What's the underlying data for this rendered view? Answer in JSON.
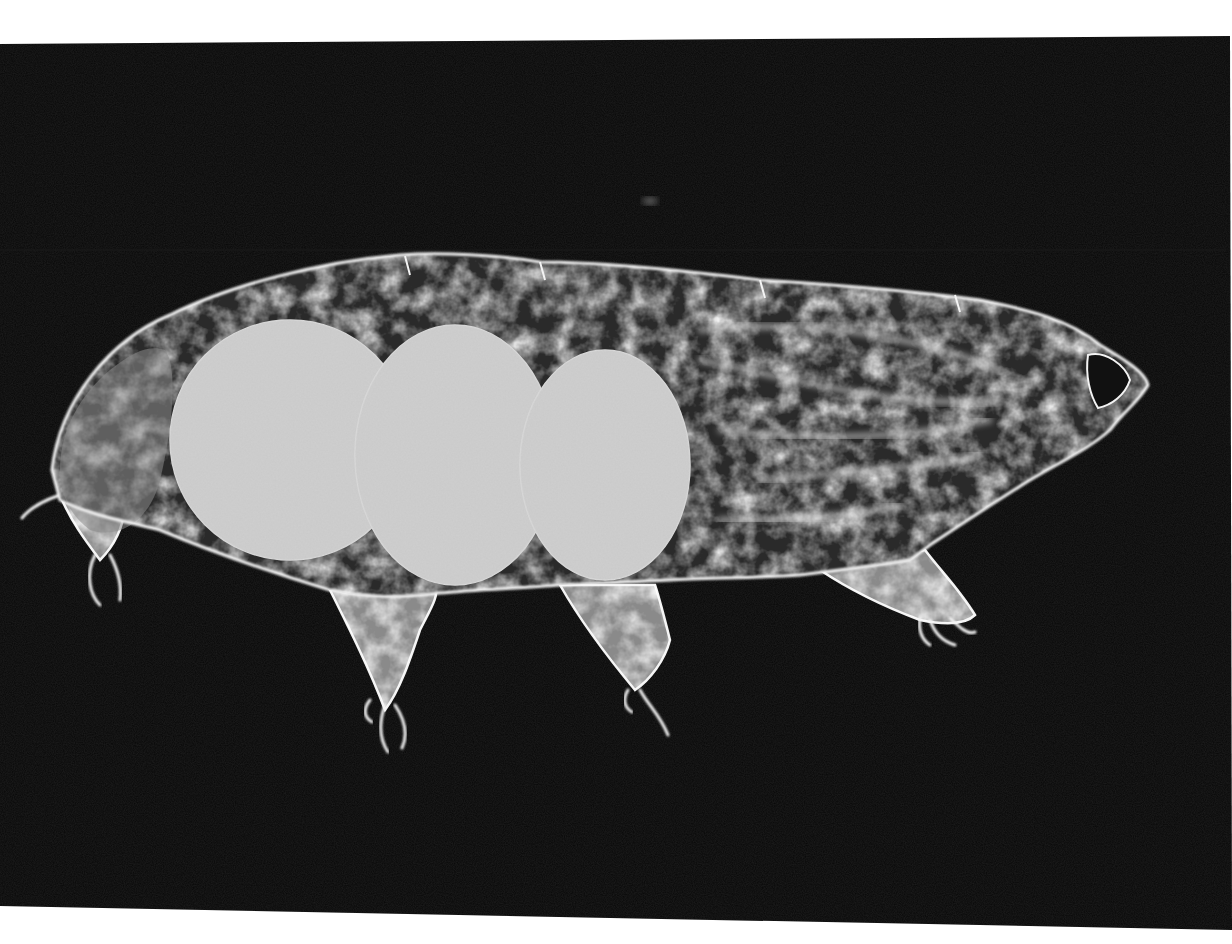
{
  "image": {
    "kind": "dark-field micrograph",
    "subject": "tardigrade (water bear), lateral view",
    "canvas": {
      "width": 1232,
      "height": 944
    },
    "colors": {
      "margin": "#ffffff",
      "field": "#070707",
      "field_noise": "#1a1a1a",
      "body_dark": "#2a2a2a",
      "body_mid": "#8a8a8a",
      "body_light": "#d8d8d8",
      "outline": "#f4f4f4",
      "gut_fill": "#cfcfcf",
      "gut_texture": "#b4b4b4"
    },
    "field_polygon": "0,44 1230,36 1232,930 0,906",
    "scanline_y": 250,
    "speck": {
      "cx": 650,
      "cy": 201,
      "rx": 8,
      "ry": 4
    },
    "body_outline": "M52,470 C60,400 110,340 170,315 C230,285 320,262 400,255 C440,252 500,255 540,262 C600,262 680,270 760,280 C840,285 920,292 980,300 C1030,310 1070,320 1100,345 C1125,360 1145,372 1148,385 C1140,400 1125,410 1110,430 C1090,448 1060,462 1030,480 C990,505 960,525 930,545 L910,560 C880,565 840,570 800,575 C760,578 700,578 670,580 L560,585 C520,588 470,590 440,593 C400,598 370,598 330,590 C280,575 220,555 160,530 C120,520 90,515 60,500 Z",
    "back_lobe": "M60,470 C60,430 80,395 110,370 C135,350 150,345 165,350 C180,370 170,440 160,480 C150,520 120,540 90,530 C70,515 60,495 60,470 Z",
    "gut_lobes": [
      {
        "cx": 290,
        "cy": 440,
        "rx": 120,
        "ry": 120
      },
      {
        "cx": 455,
        "cy": 455,
        "rx": 100,
        "ry": 130
      },
      {
        "cx": 605,
        "cy": 465,
        "rx": 85,
        "ry": 115
      }
    ],
    "muscle_bands": [
      "M700,330 C800,320 900,330 1000,370",
      "M700,360 C800,380 900,410 1000,400",
      "M720,430 C820,440 900,440 990,420",
      "M760,480 C850,470 920,470 980,455",
      "M720,520 C800,520 860,515 900,505"
    ],
    "dorsal_segments": [
      {
        "x1": 405,
        "y1": 256,
        "x2": 410,
        "y2": 275
      },
      {
        "x1": 540,
        "y1": 262,
        "x2": 545,
        "y2": 280
      },
      {
        "x1": 760,
        "y1": 280,
        "x2": 765,
        "y2": 298
      },
      {
        "x1": 955,
        "y1": 295,
        "x2": 960,
        "y2": 312
      }
    ],
    "mouth_opening": "M1088,355 C1105,350 1125,365 1130,380 C1125,395 1112,405 1098,408 C1090,395 1085,375 1088,355 Z",
    "legs": [
      {
        "name": "leg-1-rear",
        "path": "M60,495 C70,520 85,540 100,560 C115,545 125,525 125,500 Z",
        "claws": [
          "M95,555 C85,575 90,595 100,605",
          "M110,555 C118,570 122,585 120,600",
          "M60,495 C45,500 30,508 22,518"
        ]
      },
      {
        "name": "leg-2",
        "path": "M330,590 C350,630 370,670 385,710 C400,690 410,660 420,630 C430,610 440,595 435,585 Z",
        "claws": [
          "M385,705 C378,725 380,740 388,752",
          "M395,705 C405,720 408,735 402,748",
          "M370,700 C362,710 365,718 372,722"
        ]
      },
      {
        "name": "leg-3",
        "path": "M560,585 C580,620 610,660 635,690 C650,680 665,660 670,640 C665,620 660,600 655,585 Z",
        "claws": [
          "M640,690 C648,705 660,715 668,735",
          "M628,690 C622,700 625,708 632,712"
        ]
      },
      {
        "name": "leg-4-front",
        "path": "M820,570 C850,590 880,605 920,620 C945,625 965,625 975,615 C960,590 940,570 925,550 Z",
        "claws": [
          "M930,620 C935,635 945,642 955,645",
          "M950,618 C960,628 968,635 975,632",
          "M920,618 C918,630 922,640 930,645"
        ]
      }
    ]
  }
}
